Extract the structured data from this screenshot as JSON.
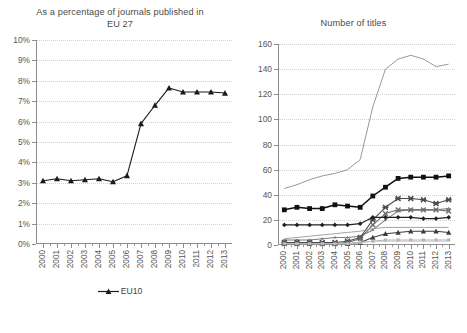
{
  "figure": {
    "left_panel": {
      "title": "As a percentage of journals published in EU 27",
      "title_line1": "As a percentage of journals published in",
      "title_line2": "EU 27"
    },
    "right_panel": {
      "title": "Number of titles"
    }
  },
  "chart_data": [
    {
      "type": "line",
      "panel": "left",
      "title": "As a percentage of journals published in EU 27",
      "xlabel": "",
      "ylabel": "",
      "x": [
        "2000",
        "2001",
        "2002",
        "2003",
        "2004",
        "2005",
        "2006",
        "2007",
        "2008",
        "2009",
        "2010",
        "2011",
        "2012",
        "2013"
      ],
      "ylim": [
        0,
        10
      ],
      "ytick_labels": [
        "0%",
        "1%",
        "2%",
        "3%",
        "4%",
        "5%",
        "6%",
        "7%",
        "8%",
        "9%",
        "10%"
      ],
      "ytick_values": [
        0,
        1,
        2,
        3,
        4,
        5,
        6,
        7,
        8,
        9,
        10
      ],
      "grid": true,
      "legend_position": "bottom",
      "series": [
        {
          "name": "EU10",
          "marker": "triangle",
          "color": "#1a1a1a",
          "values": [
            3.1,
            3.2,
            3.1,
            3.15,
            3.2,
            3.05,
            3.35,
            5.9,
            6.8,
            7.65,
            7.45,
            7.45,
            7.45,
            7.4,
            7.5
          ]
        }
      ]
    },
    {
      "type": "line",
      "panel": "right",
      "title": "Number of titles",
      "xlabel": "",
      "ylabel": "",
      "x": [
        "2000",
        "2001",
        "2002",
        "2003",
        "2004",
        "2005",
        "2006",
        "2007",
        "2008",
        "2009",
        "2010",
        "2011",
        "2012",
        "2013"
      ],
      "ylim": [
        0,
        160
      ],
      "ytick_labels": [
        "0",
        "20",
        "40",
        "60",
        "80",
        "100",
        "120",
        "140",
        "160"
      ],
      "ytick_values": [
        0,
        20,
        40,
        60,
        80,
        100,
        120,
        140,
        160
      ],
      "grid": true,
      "legend_position": "bottom",
      "series": [
        {
          "name": "BG",
          "marker": "small-diamond",
          "color": "#7d7d7d",
          "values": [
            4,
            4,
            4,
            5,
            6,
            6,
            7,
            12,
            20,
            27,
            28,
            28,
            28,
            29
          ]
        },
        {
          "name": "CZ",
          "marker": "square",
          "color": "#101010",
          "values": [
            28,
            30,
            29,
            29,
            32,
            31,
            30,
            39,
            46,
            53,
            54,
            54,
            54,
            55
          ]
        },
        {
          "name": "EE",
          "marker": "triangle",
          "color": "#3d3d3d",
          "values": [
            1,
            1,
            1,
            1,
            1,
            1,
            2,
            6,
            9,
            10,
            11,
            11,
            11,
            10
          ]
        },
        {
          "name": "HU",
          "marker": "cross-x",
          "color": "#4a4a4a",
          "values": [
            2,
            2,
            2,
            2,
            2,
            3,
            6,
            20,
            30,
            37,
            37,
            36,
            33,
            36
          ]
        },
        {
          "name": "LT",
          "marker": "x",
          "color": "#6a6a6a",
          "values": [
            1,
            1,
            1,
            1,
            1,
            2,
            5,
            16,
            25,
            28,
            28,
            28,
            28,
            27
          ]
        },
        {
          "name": "LV",
          "marker": "small-square",
          "color": "#b5b5b5",
          "values": [
            1,
            1,
            1,
            1,
            1,
            1,
            2,
            3,
            4,
            4,
            4,
            4,
            4,
            4
          ]
        },
        {
          "name": "PL",
          "marker": "none",
          "color": "#999999",
          "values": [
            5,
            6,
            7,
            8,
            9,
            10,
            11,
            13,
            14,
            14,
            14,
            14,
            14,
            14
          ]
        },
        {
          "name": "RO",
          "marker": "none",
          "color": "#8c8c8c",
          "values": [
            45,
            48,
            52,
            55,
            57,
            60,
            68,
            110,
            140,
            148,
            151,
            148,
            142,
            144
          ]
        },
        {
          "name": "SI",
          "marker": "none",
          "color": "#c2c2c2",
          "values": [
            1,
            1,
            1,
            1,
            1,
            1,
            2,
            3,
            3,
            3,
            3,
            3,
            3,
            3
          ]
        },
        {
          "name": "SK",
          "marker": "diamond",
          "color": "#202020",
          "values": [
            16,
            16,
            16,
            16,
            16,
            16,
            17,
            22,
            22,
            22,
            22,
            21,
            21,
            22
          ]
        }
      ]
    }
  ],
  "left_legend": [
    {
      "label": "EU10",
      "marker": "triangle",
      "color": "#1a1a1a"
    }
  ],
  "right_legend": [
    {
      "label": "BG",
      "marker": "small-diamond",
      "color": "#7d7d7d"
    },
    {
      "label": "CZ",
      "marker": "square",
      "color": "#101010"
    },
    {
      "label": "EE",
      "marker": "triangle",
      "color": "#3d3d3d"
    },
    {
      "label": "HU",
      "marker": "cross-x",
      "color": "#4a4a4a"
    },
    {
      "label": "LT",
      "marker": "x",
      "color": "#6a6a6a"
    },
    {
      "label": "LV",
      "marker": "small-square",
      "color": "#b5b5b5"
    },
    {
      "label": "PL",
      "marker": "none",
      "color": "#999999"
    },
    {
      "label": "RO",
      "marker": "none",
      "color": "#8c8c8c"
    },
    {
      "label": "SI",
      "marker": "none",
      "color": "#c2c2c2"
    },
    {
      "label": "SK",
      "marker": "diamond",
      "color": "#202020"
    }
  ]
}
